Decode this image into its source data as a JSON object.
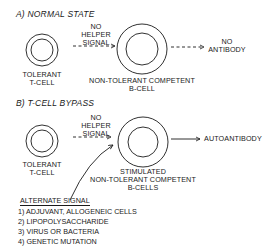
{
  "panel_a": {
    "title": "A) NORMAL STATE",
    "t_cell_label_1": "TOLERANT",
    "t_cell_label_2": "T-CELL",
    "signal_1": "NO",
    "signal_2": "HELPER",
    "signal_3": "SIGNAL",
    "b_cell_label_1": "NON-TOLERANT COMPETENT",
    "b_cell_label_2": "B-CELL",
    "output_1": "NO",
    "output_2": "ANTIBODY"
  },
  "panel_b": {
    "title": "B) T-CELL BYPASS",
    "t_cell_label_1": "TOLERANT",
    "t_cell_label_2": "T-CELL",
    "signal_1": "NO",
    "signal_2": "HELPER",
    "signal_3": "SIGNAL",
    "b_cell_label_1": "STIMULATED",
    "b_cell_label_2": "NON-TOLERANT COMPETENT",
    "b_cell_label_3": "B-CELLS",
    "output": "AUTOANTIBODY"
  },
  "alternate_signal": {
    "title": "ALTERNATE SIGNAL",
    "items": [
      "1) ADJUVANT, ALLOGENEIC CELLS",
      "2) LIPOPOLYSACCHARIDE",
      "3) VIRUS OR BACTERIA",
      "4) GENETIC MUTATION"
    ]
  }
}
